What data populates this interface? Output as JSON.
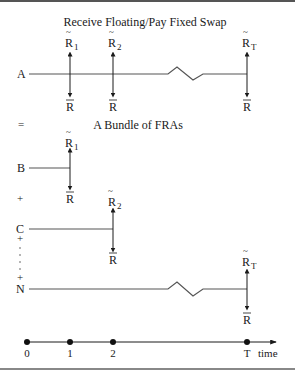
{
  "diagram": {
    "title": "Receive Floating/Pay Fixed Swap",
    "subtitle": "A Bundle of FRAs",
    "equals": "=",
    "plus": "+",
    "rows": [
      {
        "label": "A",
        "receive_labels": [
          "R",
          "R",
          "R"
        ],
        "receive_subscripts": [
          "1",
          "2",
          "T"
        ],
        "pay_label": "R",
        "has_break": true
      },
      {
        "label": "B",
        "receive_label": "R",
        "receive_subscript": "1",
        "pay_label": "R"
      },
      {
        "label": "C",
        "receive_label": "R",
        "receive_subscript": "2",
        "pay_label": "R"
      },
      {
        "label": "N",
        "receive_label": "R",
        "receive_subscript": "T",
        "pay_label": "R",
        "has_break": true
      }
    ],
    "floating_rate_mark": "~",
    "fixed_rate_mark": "‾",
    "timeline": {
      "ticks": [
        "0",
        "1",
        "2",
        "T"
      ],
      "axis_label": "time"
    }
  }
}
